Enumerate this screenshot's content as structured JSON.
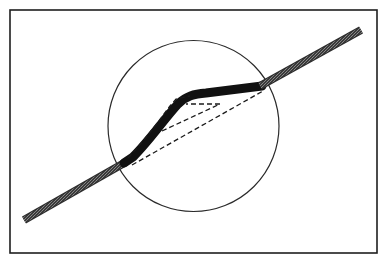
{
  "diagram": {
    "colors": {
      "background": "#ffffff",
      "frame": "#1e1e1e",
      "circle": "#2a2a2a",
      "band": "#2b2b2b",
      "band_core": "#111111",
      "dashed": "#1a1a1a"
    },
    "frame": {
      "x": 10,
      "y": 10,
      "width": 367,
      "height": 243
    },
    "circle": {
      "cx": 193.5,
      "cy": 126,
      "r": 85.5
    },
    "band": {
      "outer_left": {
        "x1": 24,
        "y1": 220,
        "x2": 124,
        "y2": 163
      },
      "kink_path": "M124,163 L133,157 C150,140 165,118 178,104 C186,96 194,94 206,93 L262,85",
      "outer_right": {
        "x1": 262,
        "y1": 85,
        "x2": 361,
        "y2": 30
      }
    },
    "dashed_lines": [
      {
        "name": "chord",
        "d": "M132,165 L263,91"
      },
      {
        "name": "inner-triangle",
        "d": "M162,131 L220,104 L186,104"
      },
      {
        "name": "upper-outline",
        "d": "M128,158 C145,140 158,122 170,106 L176,99 L190,96"
      }
    ],
    "labels": []
  }
}
